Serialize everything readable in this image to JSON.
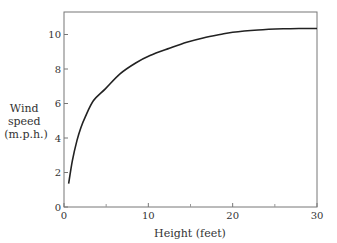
{
  "chart_data": {
    "type": "line",
    "title": "",
    "xlabel": "Height (feet)",
    "ylabel_lines": [
      "Wind",
      "speed",
      "(m.p.h.)"
    ],
    "xlim": [
      0,
      30
    ],
    "ylim": [
      0,
      11.5
    ],
    "xticks": [
      0,
      10,
      20,
      30
    ],
    "xminor_ticks": [
      5,
      15,
      25
    ],
    "yticks": [
      0,
      2,
      4,
      6,
      8,
      10
    ],
    "grid": false,
    "legend": "none",
    "series": [
      {
        "name": "Wind speed",
        "x": [
          0.55,
          1.0,
          1.54,
          2.0,
          2.5,
          3.5,
          4.9,
          6.64,
          8.5,
          10.2,
          12.5,
          14.55,
          16.5,
          18.5,
          20,
          23,
          26,
          28,
          30
        ],
        "y": [
          1.35,
          2.7,
          3.86,
          4.6,
          5.2,
          6.17,
          6.85,
          7.72,
          8.35,
          8.78,
          9.2,
          9.55,
          9.8,
          10.0,
          10.13,
          10.26,
          10.33,
          10.35,
          10.35
        ]
      }
    ]
  }
}
